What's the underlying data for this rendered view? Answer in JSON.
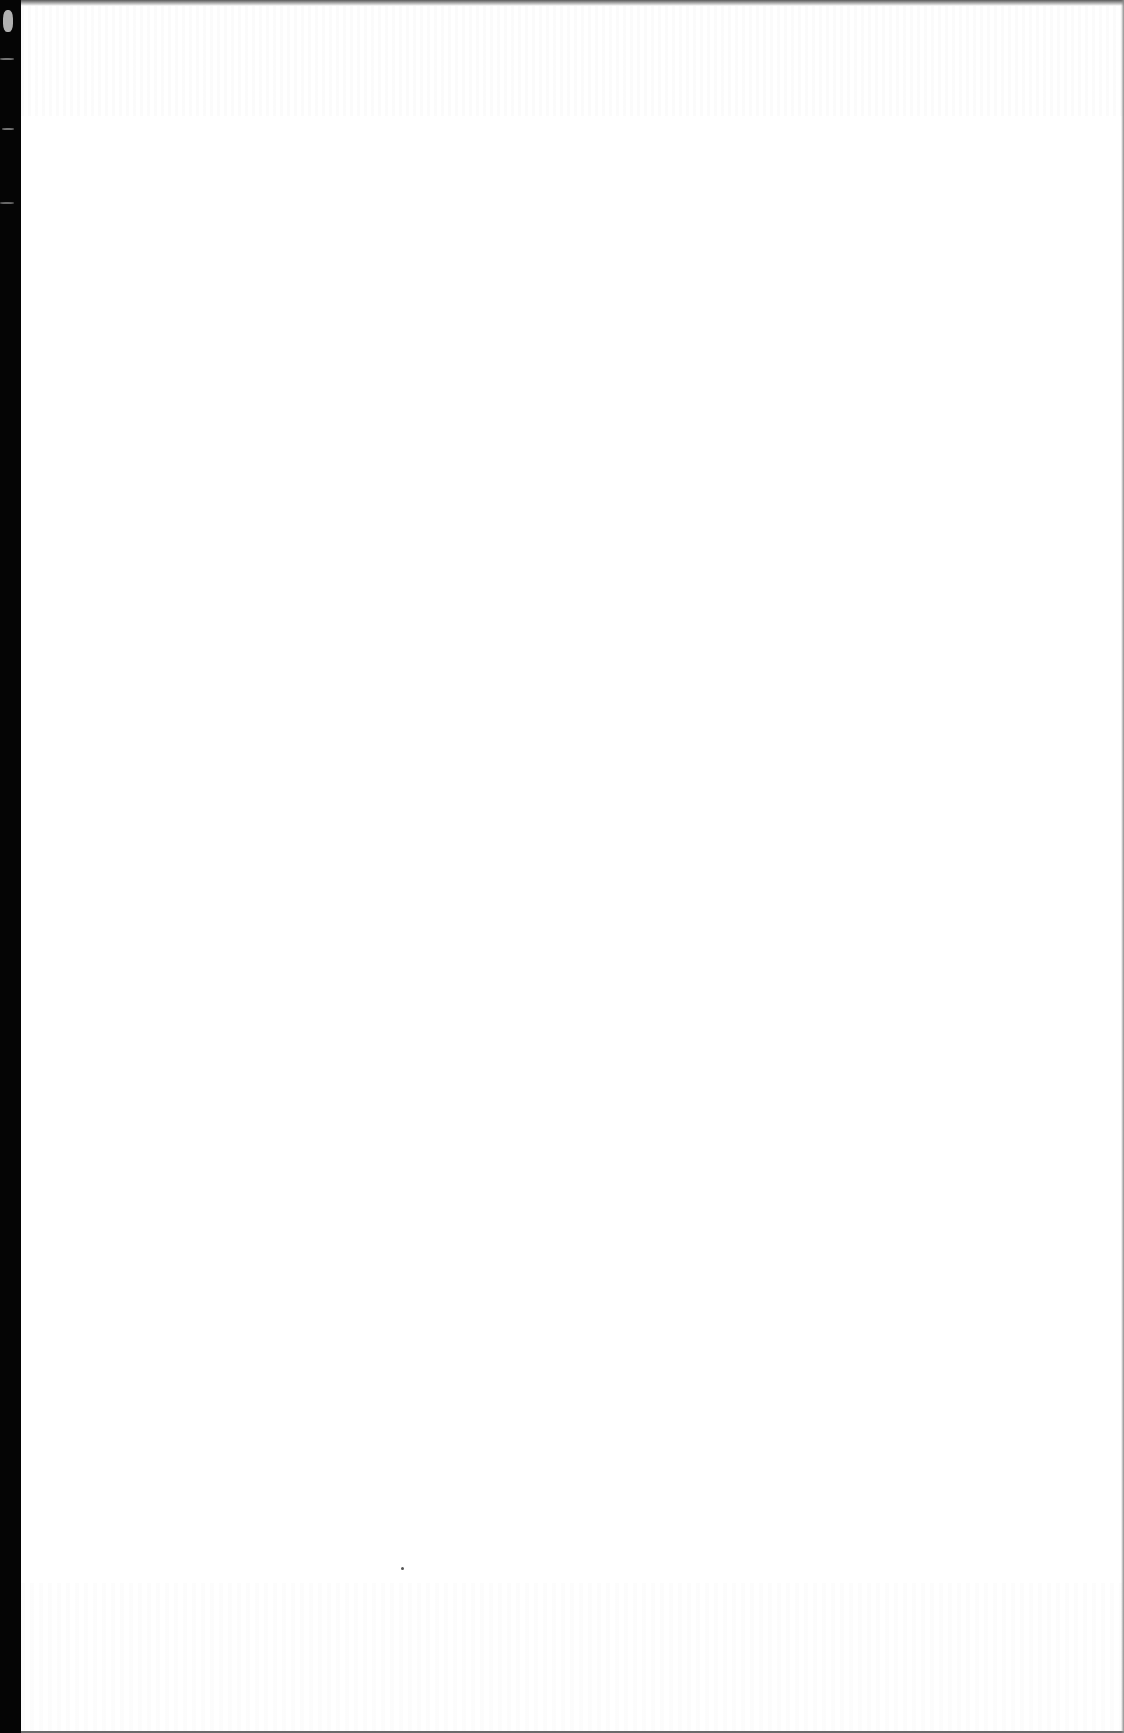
{
  "page": {
    "type": "blank scanned page",
    "content_text": "",
    "description": "Blank white page with black binding edge on left and faint show-through"
  },
  "colors": {
    "paper": "#ffffff",
    "binding_edge": "#050505",
    "show_through": "#d0d0d0"
  }
}
